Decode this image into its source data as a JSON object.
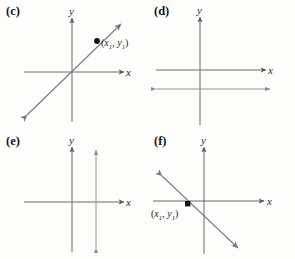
{
  "figure": {
    "background_color": "#fdfdfc",
    "line_color": "#6f6f6f",
    "axis_color": "#595959",
    "point_color": "#000000",
    "text_color": "#151515"
  },
  "panels": [
    {
      "id": "c",
      "letter": "(c)",
      "x_axis_label": "x",
      "y_axis_label": "y",
      "point_label": "(x1, y1)",
      "point_label_parts": {
        "open": "(",
        "x": "x",
        "xsub": "1",
        "comma": ", ",
        "y": "y",
        "ysub": "1",
        "close": ")"
      },
      "graph_type": "line",
      "slope_description": "positive slope through origin region, arrows on both ends",
      "has_point": true
    },
    {
      "id": "d",
      "letter": "(d)",
      "x_axis_label": "x",
      "y_axis_label": "y",
      "point_label": "",
      "graph_type": "horizontal-line",
      "slope_description": "horizontal line below the x-axis, arrows on both ends",
      "has_point": false
    },
    {
      "id": "e",
      "letter": "(e)",
      "x_axis_label": "x",
      "y_axis_label": "y",
      "point_label": "",
      "graph_type": "vertical-line",
      "slope_description": "vertical line to the right of the y-axis, arrows on both ends",
      "has_point": false
    },
    {
      "id": "f",
      "letter": "(f)",
      "x_axis_label": "x",
      "y_axis_label": "y",
      "point_label": "(x1, y1)",
      "point_label_parts": {
        "open": "(",
        "x": "x",
        "xsub": "1",
        "comma": ", ",
        "y": "y",
        "ysub": "1",
        "close": ")"
      },
      "graph_type": "line",
      "slope_description": "negative slope crossing into fourth quadrant, arrows on both ends",
      "has_point": true
    }
  ]
}
